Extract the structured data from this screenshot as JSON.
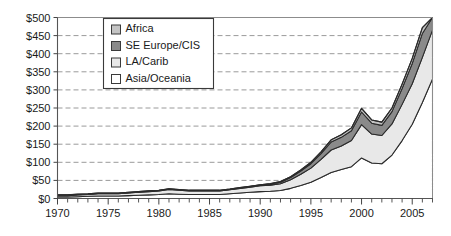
{
  "chart_data": {
    "type": "area",
    "stacked": true,
    "title": "",
    "subtitle": "",
    "xlabel": "",
    "ylabel": "",
    "xlim": [
      1970,
      2007
    ],
    "ylim": [
      0,
      500
    ],
    "grid": true,
    "legend_position": "top-left-inside",
    "y_tick_labels": [
      "$0",
      "$50",
      "$100",
      "$150",
      "$200",
      "$250",
      "$300",
      "$350",
      "$400",
      "$450",
      "$500"
    ],
    "y_tick_values": [
      0,
      50,
      100,
      150,
      200,
      250,
      300,
      350,
      400,
      450,
      500
    ],
    "x_tick_labels": [
      "1970",
      "1975",
      "1980",
      "1985",
      "1990",
      "1995",
      "2000",
      "2005"
    ],
    "x_tick_values": [
      1970,
      1975,
      1980,
      1985,
      1990,
      1995,
      2000,
      2005
    ],
    "x": [
      1970,
      1971,
      1972,
      1973,
      1974,
      1975,
      1976,
      1977,
      1978,
      1979,
      1980,
      1981,
      1982,
      1983,
      1984,
      1985,
      1986,
      1987,
      1988,
      1989,
      1990,
      1991,
      1992,
      1993,
      1994,
      1995,
      1996,
      1997,
      1998,
      1999,
      2000,
      2001,
      2002,
      2003,
      2004,
      2005,
      2006,
      2007
    ],
    "series": [
      {
        "name": "Asia/Oceania",
        "color": "#ffffff",
        "values": [
          4,
          4,
          5,
          6,
          7,
          7,
          7,
          8,
          9,
          10,
          11,
          13,
          12,
          11,
          11,
          11,
          11,
          13,
          15,
          17,
          19,
          20,
          22,
          28,
          36,
          45,
          58,
          72,
          80,
          88,
          112,
          98,
          96,
          120,
          160,
          205,
          265,
          330
        ]
      },
      {
        "name": "LA/Carib",
        "color": "#e8e8e8",
        "values": [
          4,
          4,
          5,
          5,
          6,
          6,
          6,
          7,
          8,
          9,
          10,
          12,
          11,
          10,
          10,
          10,
          10,
          11,
          13,
          14,
          16,
          17,
          19,
          24,
          31,
          39,
          50,
          62,
          65,
          72,
          92,
          80,
          78,
          86,
          100,
          112,
          125,
          135
        ]
      },
      {
        "name": "SE Europe/CIS",
        "color": "#8a8a8a",
        "values": [
          1,
          1,
          1,
          1,
          1,
          1,
          1,
          1,
          1,
          1,
          1,
          1,
          1,
          1,
          1,
          1,
          1,
          1,
          1,
          2,
          2,
          3,
          4,
          6,
          9,
          12,
          16,
          22,
          24,
          27,
          35,
          30,
          28,
          34,
          44,
          56,
          66,
          72
        ]
      },
      {
        "name": "Africa",
        "color": "#c4c4c4",
        "values": [
          1,
          1,
          1,
          1,
          1,
          1,
          1,
          1,
          1,
          1,
          1,
          1,
          1,
          1,
          1,
          1,
          1,
          1,
          1,
          1,
          1,
          1,
          2,
          2,
          3,
          4,
          5,
          6,
          7,
          8,
          10,
          9,
          9,
          10,
          12,
          14,
          16,
          18
        ]
      }
    ],
    "totals": [
      10,
      10,
      12,
      13,
      15,
      15,
      15,
      17,
      19,
      21,
      23,
      27,
      25,
      23,
      23,
      23,
      23,
      26,
      30,
      34,
      38,
      41,
      47,
      60,
      79,
      100,
      129,
      162,
      176,
      195,
      249,
      217,
      211,
      250,
      316,
      387,
      472,
      555
    ]
  },
  "legend": {
    "items": [
      {
        "label": "Africa",
        "swatch": "#c4c4c4"
      },
      {
        "label": "SE Europe/CIS",
        "swatch": "#8a8a8a"
      },
      {
        "label": "LA/Carib",
        "swatch": "#e8e8e8"
      },
      {
        "label": "Asia/Oceania",
        "swatch": "#ffffff"
      }
    ]
  }
}
